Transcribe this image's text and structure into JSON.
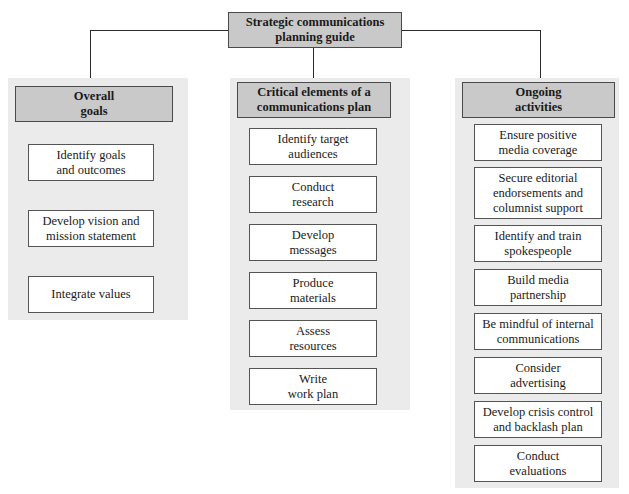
{
  "root": {
    "label": "Strategic communications\nplanning guide"
  },
  "columns": [
    {
      "header": "Overall\ngoals",
      "items": [
        "Identify goals\nand outcomes",
        "Develop vision and\nmission statement",
        "Integrate values"
      ]
    },
    {
      "header": "Critical elements of a\ncommunications plan",
      "items": [
        "Identify target\naudiences",
        "Conduct\nresearch",
        "Develop\nmessages",
        "Produce\nmaterials",
        "Assess\nresources",
        "Write\nwork plan"
      ]
    },
    {
      "header": "Ongoing\nactivities",
      "items": [
        "Ensure positive\nmedia coverage",
        "Secure editorial\nendorsements and\ncolumnist support",
        "Identify and train\nspokespeople",
        "Build media\npartnership",
        "Be mindful of internal\ncommunications",
        "Consider\nadvertising",
        "Develop crisis control\nand backlash plan",
        "Conduct\nevaluations"
      ]
    }
  ],
  "colors": {
    "header_fill": "#c9c9c9",
    "panel_fill": "#ebebeb",
    "item_fill": "#ffffff",
    "border": "#4a4a4a"
  }
}
